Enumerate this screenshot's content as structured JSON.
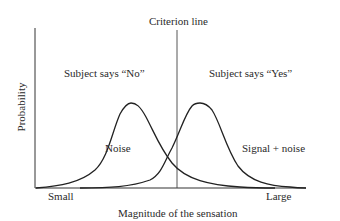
{
  "diagram": {
    "title": "Criterion line",
    "y_axis_label": "Probability",
    "x_axis_label": "Magnitude of the sensation",
    "x_axis_min_label": "Small",
    "x_axis_max_label": "Large",
    "region_left_label": "Subject says “No”",
    "region_right_label": "Subject says “Yes”",
    "curves": [
      {
        "name": "noise",
        "label": "Noise"
      },
      {
        "name": "signal-plus-noise",
        "label": "Signal + noise"
      }
    ]
  }
}
